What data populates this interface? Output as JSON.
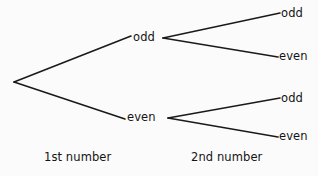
{
  "diagram": {
    "type": "probability-tree",
    "title": "",
    "background_color": "#fbfbfb",
    "line_color": "#1a1a1a",
    "text_color": "#141414",
    "root": {
      "x": 14,
      "y": 82
    },
    "stages": [
      {
        "id": "stage-1",
        "label": "1st number"
      },
      {
        "id": "stage-2",
        "label": "2nd number"
      }
    ],
    "nodes": {
      "level1": [
        {
          "id": "l1-odd",
          "label": "odd",
          "x": 131,
          "y": 38
        },
        {
          "id": "l1-even",
          "label": "even",
          "x": 125,
          "y": 118
        }
      ],
      "level2": [
        {
          "id": "l2-odd-odd",
          "label": "odd",
          "parent": "l1-odd",
          "x": 280,
          "y": 14
        },
        {
          "id": "l2-odd-even",
          "label": "even",
          "parent": "l1-odd",
          "x": 278,
          "y": 57
        },
        {
          "id": "l2-even-odd",
          "label": "odd",
          "parent": "l1-even",
          "x": 280,
          "y": 99
        },
        {
          "id": "l2-even-even",
          "label": "even",
          "parent": "l1-even",
          "x": 278,
          "y": 137
        }
      ]
    },
    "edges": [
      {
        "id": "edge-root-odd",
        "from": "root",
        "to": "l1-odd",
        "x1": 14,
        "y1": 82,
        "x2": 131,
        "y2": 36
      },
      {
        "id": "edge-root-even",
        "from": "root",
        "to": "l1-even",
        "x1": 14,
        "y1": 82,
        "x2": 125,
        "y2": 119
      },
      {
        "id": "edge-odd-odd",
        "from": "l1-odd",
        "to": "l2-odd-odd",
        "x1": 163,
        "y1": 38,
        "x2": 280,
        "y2": 13
      },
      {
        "id": "edge-odd-even",
        "from": "l1-odd",
        "to": "l2-odd-even",
        "x1": 163,
        "y1": 38,
        "x2": 278,
        "y2": 57
      },
      {
        "id": "edge-even-odd",
        "from": "l1-even",
        "to": "l2-even-odd",
        "x1": 168,
        "y1": 118,
        "x2": 280,
        "y2": 98
      },
      {
        "id": "edge-even-even",
        "from": "l1-even",
        "to": "l2-even-even",
        "x1": 168,
        "y1": 118,
        "x2": 278,
        "y2": 137
      }
    ]
  }
}
